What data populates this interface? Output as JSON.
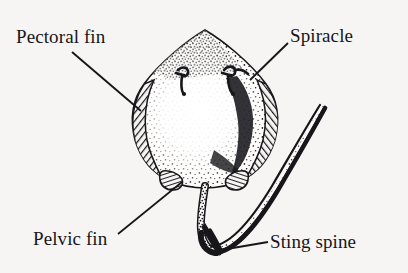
{
  "figure": {
    "view": "dorsal view",
    "style": "black-and-white stippled line drawing",
    "background_color": "#f6f5f3",
    "ink_color": "#17161a",
    "width": 408,
    "height": 273
  },
  "labels": [
    {
      "id": "pectoral-fin",
      "text": "Pectoral fin",
      "position": {
        "x": 16,
        "y": 27
      },
      "leader_from": {
        "x": 72,
        "y": 52
      },
      "leader_to": {
        "x": 141,
        "y": 111
      }
    },
    {
      "id": "spiracle",
      "text": "Spiracle",
      "position": {
        "x": 290,
        "y": 26
      },
      "leader_from": {
        "x": 288,
        "y": 43
      },
      "leader_to": {
        "x": 250,
        "y": 80
      }
    },
    {
      "id": "pelvic-fin",
      "text": "Pelvic fin",
      "position": {
        "x": 33,
        "y": 229
      },
      "leader_from": {
        "x": 118,
        "y": 234
      },
      "leader_to": {
        "x": 182,
        "y": 182
      }
    },
    {
      "id": "sting-spine",
      "text": "Sting spine",
      "position": {
        "x": 270,
        "y": 232
      },
      "leader_from": {
        "x": 268,
        "y": 242
      },
      "leader_to": {
        "x": 221,
        "y": 250
      }
    }
  ],
  "anatomy_parts": [
    {
      "id": "disc",
      "name": "Body disc"
    },
    {
      "id": "snout",
      "name": "Snout"
    },
    {
      "id": "pectoral-fin-left",
      "name": "Left pectoral fin"
    },
    {
      "id": "pectoral-fin-right",
      "name": "Right pectoral fin"
    },
    {
      "id": "spiracle-left",
      "name": "Left spiracle"
    },
    {
      "id": "spiracle-right",
      "name": "Right spiracle"
    },
    {
      "id": "pelvic-fin-left",
      "name": "Left pelvic fin"
    },
    {
      "id": "pelvic-fin-right",
      "name": "Right pelvic fin"
    },
    {
      "id": "tail",
      "name": "Tail"
    },
    {
      "id": "sting-spine",
      "name": "Sting spine"
    }
  ]
}
